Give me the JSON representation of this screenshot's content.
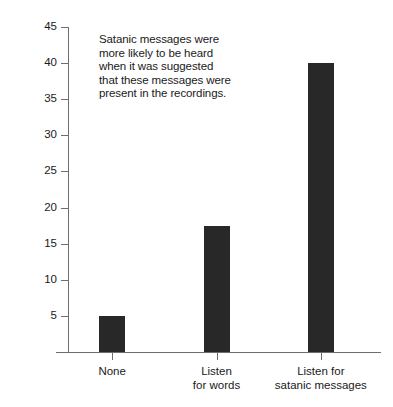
{
  "chart_data": {
    "type": "bar",
    "title": "",
    "xlabel": "",
    "ylabel": "Percent hearing satanic-related words",
    "categories": [
      "None",
      "Listen for words",
      "Listen for satanic messages"
    ],
    "category_lines": [
      [
        "None"
      ],
      [
        "Listen",
        "for words"
      ],
      [
        "Listen for",
        "satanic messages"
      ]
    ],
    "values": [
      5,
      17.5,
      40
    ],
    "ylim": [
      0,
      45
    ],
    "yticks": [
      5,
      10,
      15,
      20,
      25,
      30,
      35,
      40,
      45
    ],
    "ytick_labels": [
      "5",
      "10",
      "15",
      "20",
      "25",
      "30",
      "35",
      "40",
      "45"
    ],
    "grid": false,
    "legend": false,
    "legend_position": "none",
    "bar_color": "#282828",
    "axis_color": "#6e6e6e",
    "background_color": "#ffffff",
    "annotation": {
      "lines": [
        "Satanic messages were",
        "more likely to be heard",
        "when it was suggested",
        "that these messages were",
        "present in the recordings."
      ]
    }
  }
}
